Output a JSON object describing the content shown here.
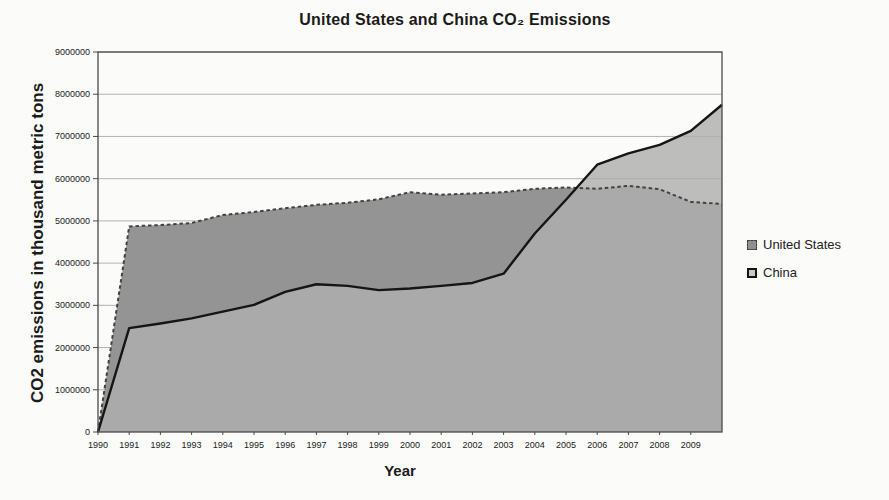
{
  "figure": {
    "title": "United States and China CO₂ Emissions",
    "y_axis_title": "CO2 emissions in thousand metric tons",
    "x_axis_title": "Year"
  },
  "chart_data": {
    "type": "area",
    "title": "United States and China CO₂ Emissions",
    "xlabel": "Year",
    "ylabel": "CO2 emissions in thousand metric tons",
    "xlim": [
      1990,
      2010
    ],
    "ylim": [
      0,
      9000000
    ],
    "grid": "horizontal",
    "grid_color": "#b3b3b3",
    "axis_color": "#4a4a4a",
    "legend_position": "right",
    "x": [
      1990,
      1991,
      1992,
      1993,
      1994,
      1995,
      1996,
      1997,
      1998,
      1999,
      2000,
      2001,
      2002,
      2003,
      2004,
      2005,
      2006,
      2007,
      2008,
      2009,
      2010
    ],
    "x_tick_labels": [
      "1990",
      "1991",
      "1992",
      "1993",
      "1994",
      "1995",
      "1996",
      "1997",
      "1998",
      "1999",
      "2000",
      "2001",
      "2002",
      "2003",
      "2004",
      "2005",
      "2006",
      "2007",
      "2008",
      "2009"
    ],
    "y_ticks": [
      0,
      1000000,
      2000000,
      3000000,
      4000000,
      5000000,
      6000000,
      7000000,
      8000000,
      9000000
    ],
    "series": [
      {
        "name": "United States",
        "values": [
          0,
          4870000,
          4900000,
          4950000,
          5140000,
          5210000,
          5300000,
          5380000,
          5430000,
          5510000,
          5680000,
          5620000,
          5650000,
          5680000,
          5760000,
          5790000,
          5760000,
          5830000,
          5750000,
          5450000,
          5400000
        ],
        "fill": "#949494",
        "fill_opacity": 1,
        "legend_fill": "#8f8f8f",
        "line_color": "#424242",
        "line_style": "dashed",
        "line_width": 2
      },
      {
        "name": "China",
        "values": [
          0,
          2460000,
          2570000,
          2690000,
          2850000,
          3010000,
          3320000,
          3500000,
          3460000,
          3360000,
          3400000,
          3460000,
          3530000,
          3750000,
          4700000,
          5500000,
          6330000,
          6600000,
          6800000,
          7130000,
          7750000
        ],
        "fill": "#aeaeae",
        "fill_opacity": 0.82,
        "legend_fill": "#c9c9c9",
        "line_color": "#151515",
        "line_style": "solid",
        "line_width": 2.4
      }
    ]
  }
}
